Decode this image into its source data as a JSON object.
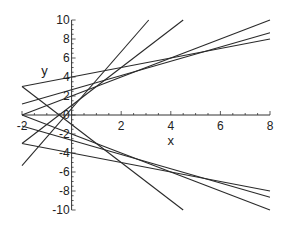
{
  "chart_data": {
    "type": "line",
    "title": "",
    "xlabel": "x",
    "ylabel": "y",
    "xlim": [
      -2,
      8
    ],
    "ylim": [
      -10,
      10
    ],
    "grid": false,
    "legend": "none",
    "x_ticks": [
      -2,
      2,
      4,
      6,
      8
    ],
    "x_tick_labels": [
      "-2",
      "2",
      "4",
      "6",
      "8"
    ],
    "y_ticks": [
      -10,
      -8,
      -6,
      -4,
      -2,
      0,
      2,
      4,
      6,
      8,
      10
    ],
    "y_tick_labels": [
      "-10",
      "-8",
      "-6",
      "-4",
      "-2",
      "0",
      "2",
      "4",
      "6",
      "8",
      "10"
    ],
    "series": [
      {
        "name": "m=3",
        "slope": 3,
        "intercept": 0.6667
      },
      {
        "name": "m=2",
        "slope": 2,
        "intercept": 1
      },
      {
        "name": "m=1",
        "slope": 1,
        "intercept": 2
      },
      {
        "name": "m=0.75",
        "slope": 0.75,
        "intercept": 2.6667
      },
      {
        "name": "m=0.5",
        "slope": 0.5,
        "intercept": 4
      },
      {
        "name": "m=-0.5",
        "slope": -0.5,
        "intercept": -4
      },
      {
        "name": "m=-0.75",
        "slope": -0.75,
        "intercept": -2.6667
      },
      {
        "name": "m=-1",
        "slope": -1,
        "intercept": -2
      },
      {
        "name": "m=-2",
        "slope": -2,
        "intercept": -1
      }
    ]
  }
}
